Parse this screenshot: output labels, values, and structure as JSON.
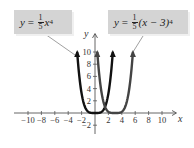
{
  "chart_data": {
    "type": "line",
    "title": "",
    "xlabel": "x",
    "ylabel": "y",
    "xlim": [
      -11,
      11
    ],
    "ylim": [
      -3,
      11
    ],
    "x_ticks": [
      -10,
      -8,
      -6,
      -4,
      -2,
      2,
      4,
      6,
      8,
      10
    ],
    "y_ticks": [
      -2,
      2,
      4,
      6,
      8,
      10
    ],
    "x_tick_labels": [
      "−10",
      "−8",
      "−6",
      "−4",
      "−2",
      "2",
      "4",
      "6",
      "8",
      "10"
    ],
    "y_tick_labels": [
      "−2",
      "2",
      "4",
      "6",
      "8",
      "10"
    ],
    "grid": false,
    "series": [
      {
        "name": "y = (1/5)x^4",
        "equation": "y = 1/5 x^4",
        "color": "#111111",
        "x": [
          -2.66,
          -2.5,
          -2,
          -1.5,
          -1,
          -0.5,
          0,
          0.5,
          1,
          1.5,
          2,
          2.5,
          2.66
        ],
        "y": [
          10.0,
          7.81,
          3.2,
          1.01,
          0.2,
          0.0125,
          0,
          0.0125,
          0.2,
          1.01,
          3.2,
          7.81,
          10.0
        ]
      },
      {
        "name": "y = (1/5)(x − 3)^4",
        "equation": "y = 1/5 (x - 3)^4",
        "color": "#444444",
        "x": [
          0.34,
          0.5,
          1,
          1.5,
          2,
          2.5,
          3,
          3.5,
          4,
          4.5,
          5,
          5.5,
          5.66
        ],
        "y": [
          10.0,
          7.81,
          3.2,
          1.01,
          0.2,
          0.0125,
          0,
          0.0125,
          0.2,
          1.01,
          3.2,
          7.81,
          10.0
        ]
      }
    ],
    "annotations": [
      {
        "text": "y = 1/5 x^4",
        "points_to": "left branch of y = 1/5 x^4"
      },
      {
        "text": "y = 1/5 (x − 3)^4",
        "points_to": "right branch of y = 1/5 (x − 3)^4"
      }
    ]
  },
  "labels": {
    "left": {
      "y": "y",
      "eq": "=",
      "num": "1",
      "den": "5",
      "var": "x",
      "exp": "4"
    },
    "right": {
      "y": "y",
      "eq": "=",
      "num": "1",
      "den": "5",
      "expr": "(x − 3)",
      "exp": "4"
    },
    "x_axis": "x",
    "y_axis": "y"
  }
}
